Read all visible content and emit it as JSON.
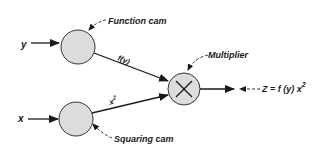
{
  "diagram": {
    "inputs": {
      "y": "y",
      "x": "x"
    },
    "nodes": {
      "function_cam": {
        "label": "Function cam"
      },
      "squaring_cam": {
        "label": "Squaring cam"
      },
      "multiplier": {
        "label": "Multiplier",
        "symbol": "×"
      }
    },
    "edges": {
      "f_of_y": "f(y)",
      "x_squared_base": "x",
      "x_squared_exp": "2"
    },
    "output": {
      "prefix": "Z = f (y) x",
      "exp": "2"
    },
    "colors": {
      "node_fill": "#dcdcdc",
      "stroke": "#1a1a1a"
    }
  }
}
